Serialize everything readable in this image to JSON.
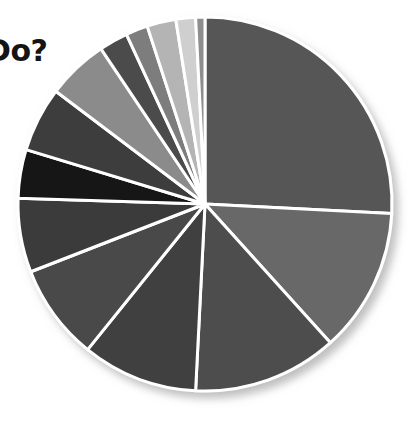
{
  "page": {
    "background": "#ffffff",
    "width": 411,
    "height": 422
  },
  "title_fragment": {
    "text": "Do?",
    "note": "partially cropped heading at left edge",
    "color": "#141414"
  },
  "chart_data": {
    "type": "pie",
    "title": "Do?",
    "xlabel": "",
    "ylabel": "",
    "legend_position": "none",
    "grid": false,
    "start_angle_deg": 0,
    "direction": "clockwise",
    "center": {
      "x": 205,
      "y": 204
    },
    "radius": 187,
    "separator_color": "#ffffff",
    "separator_width": 3,
    "categories": [
      "Segment 1",
      "Segment 2",
      "Segment 3",
      "Segment 4",
      "Segment 5",
      "Segment 6",
      "Segment 7",
      "Segment 8",
      "Segment 9",
      "Segment 10",
      "Segment 11",
      "Segment 12",
      "Segment 13",
      "Segment 14"
    ],
    "values": [
      25.8,
      12.5,
      12.5,
      10.0,
      8.3,
      6.4,
      4.2,
      5.6,
      5.3,
      2.5,
      1.9,
      2.5,
      1.7,
      0.8
    ],
    "colors": [
      "#565656",
      "#676767",
      "#4d4d4d",
      "#3f3f3f",
      "#4a4a4a",
      "#3b3b3b",
      "#131313",
      "#3c3c3c",
      "#8b8b8b",
      "#4c4c4c",
      "#7d7d7d",
      "#b4b4b4",
      "#cfcfcf",
      "#8e8e8e"
    ],
    "total": 100
  }
}
